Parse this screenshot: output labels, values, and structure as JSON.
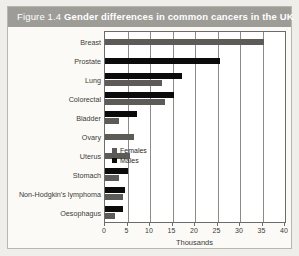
{
  "figure": {
    "number": "Figure 1.4",
    "title": "Gender differences in common cancers in the UK"
  },
  "legend": {
    "position": "inside-right",
    "items": [
      {
        "label": "Females",
        "color": "#5d5b58"
      },
      {
        "label": "Males",
        "color": "#0b0b0b"
      }
    ]
  },
  "chart_data": {
    "type": "bar",
    "orientation": "horizontal",
    "title": "Gender differences in common cancers in the UK",
    "xlabel": "Thousands",
    "ylabel": "",
    "xlim": [
      0,
      40
    ],
    "xticks": [
      0,
      5,
      10,
      15,
      20,
      25,
      30,
      35,
      40
    ],
    "xticklabels": [
      "0",
      "5",
      "10",
      "15",
      "20",
      "25",
      "30",
      "35",
      "40"
    ],
    "grid": true,
    "categories": [
      "Breast",
      "Prostate",
      "Lung",
      "Colorectal",
      "Bladder",
      "Ovary",
      "Uterus",
      "Stomach",
      "Non-Hodgkin's lymphoma",
      "Oesophagus"
    ],
    "series": [
      {
        "name": "Females",
        "color": "#5d5b58",
        "values": [
          35.3,
          0,
          12.7,
          13.3,
          3.0,
          6.5,
          5.5,
          3.0,
          4.0,
          2.2
        ]
      },
      {
        "name": "Males",
        "color": "#0b0b0b",
        "values": [
          0,
          25.5,
          17.0,
          15.3,
          7.0,
          0,
          0,
          5.0,
          4.5,
          4.0
        ]
      }
    ]
  }
}
